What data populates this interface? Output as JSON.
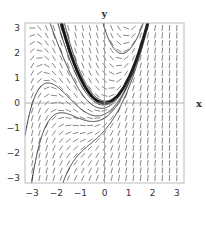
{
  "chart_data": {
    "type": "line",
    "subtype": "slope-field",
    "title": "",
    "xlabel": "x",
    "ylabel": "y",
    "xlim": [
      -3.3,
      3.3
    ],
    "ylim": [
      -3.2,
      3.2
    ],
    "xticks": [
      -3,
      -2,
      -1,
      0,
      1,
      2,
      3
    ],
    "yticks": [
      -3,
      -2,
      -1,
      0,
      1,
      2,
      3
    ],
    "grid": false,
    "differential_equation": "dy/dx = x^2 + 2x - y",
    "slope_field": {
      "nx": 21,
      "ny": 21,
      "segment_length": 0.22
    },
    "series": [
      {
        "name": "particular solution y = x^2",
        "C": 0,
        "style": "thick"
      },
      {
        "name": "solution C=-0.03",
        "C": -0.03,
        "style": "thin"
      },
      {
        "name": "solution C=0.03",
        "C": 0.03,
        "style": "thin"
      },
      {
        "name": "solution C=-0.08",
        "C": -0.08,
        "style": "thin"
      },
      {
        "name": "solution C=0.08",
        "C": 0.08,
        "style": "thin"
      },
      {
        "name": "solution C=-0.2",
        "C": -0.2,
        "style": "thin"
      },
      {
        "name": "solution C=3",
        "C": 3,
        "style": "thin"
      },
      {
        "name": "solution C=-0.6",
        "C": -0.6,
        "style": "thin"
      },
      {
        "name": "solution C=-1.1",
        "C": -1.1,
        "style": "thin"
      },
      {
        "name": "solution C=-0.05 (low branch)",
        "C": -0.45,
        "style": "thin"
      }
    ]
  },
  "colors": {
    "frame": "#bbbbbb",
    "axis": "#999999",
    "segment": "#555555",
    "curve": "#222222",
    "thick_curve": "#111111"
  },
  "labels": {
    "x_axis": "x",
    "y_axis": "y"
  }
}
